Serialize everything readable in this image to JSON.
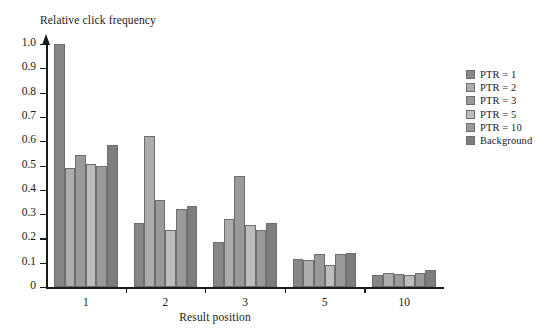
{
  "chart_data": {
    "type": "bar",
    "title": "",
    "ylabel": "Relative click frequency",
    "xlabel": "Result position",
    "categories": [
      "1",
      "2",
      "3",
      "5",
      "10"
    ],
    "ylim": [
      0,
      1.0
    ],
    "ytick_labels": [
      "0",
      "0.1",
      "0.2",
      "0.3",
      "0.4",
      "0.5",
      "0.6",
      "0.7",
      "0.8",
      "0.9",
      "1.0"
    ],
    "ytick_values": [
      0,
      0.1,
      0.2,
      0.3,
      0.4,
      0.5,
      0.6,
      0.7,
      0.8,
      0.9,
      1.0
    ],
    "grid": false,
    "legend_position": "right",
    "series": [
      {
        "name": "PTR = 1",
        "color": "#878787",
        "values": [
          1.0,
          0.265,
          0.185,
          0.115,
          0.05
        ]
      },
      {
        "name": "PTR = 2",
        "color": "#adadad",
        "values": [
          0.49,
          0.62,
          0.28,
          0.11,
          0.057
        ]
      },
      {
        "name": "PTR = 3",
        "color": "#9a9a9a",
        "values": [
          0.545,
          0.36,
          0.455,
          0.135,
          0.052
        ]
      },
      {
        "name": "PTR = 5",
        "color": "#bdbdbd",
        "values": [
          0.505,
          0.235,
          0.255,
          0.09,
          0.05
        ]
      },
      {
        "name": "PTR = 10",
        "color": "#9a9a9a",
        "values": [
          0.5,
          0.32,
          0.235,
          0.135,
          0.058
        ]
      },
      {
        "name": "Background",
        "color": "#7d7d7d",
        "values": [
          0.585,
          0.335,
          0.265,
          0.14,
          0.07
        ]
      }
    ]
  },
  "legend": {
    "items": [
      {
        "label": "PTR = 1"
      },
      {
        "label": "PTR = 2"
      },
      {
        "label": "PTR = 3"
      },
      {
        "label": "PTR = 5"
      },
      {
        "label": "PTR = 10"
      },
      {
        "label": "Background"
      }
    ]
  }
}
